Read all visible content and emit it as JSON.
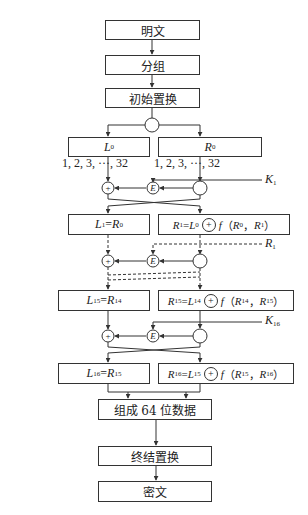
{
  "diagram": {
    "steps": {
      "plaintext": "明文",
      "grouping": "分组",
      "initial_permutation": "初始置换",
      "combine_64": "组成 64 位数据",
      "final_permutation": "终结置换",
      "ciphertext": "密文"
    },
    "round0": {
      "left": {
        "sym": "L",
        "sub": "0"
      },
      "right": {
        "sym": "R",
        "sub": "0"
      },
      "left_indices": "1, 2, 3, ···, 32",
      "right_indices": "1, 2, 3, ···, 32",
      "key": {
        "sym": "K",
        "sub": "1"
      }
    },
    "round1": {
      "left": {
        "lhs": "L",
        "lhs_sub": "1",
        "eq": "=",
        "rhs": "R",
        "rhs_sub": "0"
      },
      "right": {
        "lhs": "R",
        "lhs_sub": "1",
        "eq": "=",
        "a": "L",
        "a_sub": "0",
        "f": "f",
        "open": "（",
        "p1": "R",
        "p1_sub": "0",
        "comma": "，",
        "p2": "R",
        "p2_sub": "1",
        "close": "）"
      },
      "key": {
        "sym": "R",
        "sub": "1"
      }
    },
    "round15": {
      "left": {
        "lhs": "L",
        "lhs_sub": "15",
        "eq": "=",
        "rhs": "R",
        "rhs_sub": "14"
      },
      "right": {
        "lhs": "R",
        "lhs_sub": "15",
        "eq": "=",
        "a": "L",
        "a_sub": "14",
        "f": "f",
        "open": "（",
        "p1": "R",
        "p1_sub": "14",
        "comma": "，",
        "p2": "R",
        "p2_sub": "15",
        "close": "）"
      },
      "key": {
        "sym": "K",
        "sub": "16"
      }
    },
    "round16": {
      "left": {
        "lhs": "L",
        "lhs_sub": "16",
        "eq": "=",
        "rhs": "R",
        "rhs_sub": "15"
      },
      "right": {
        "lhs": "R",
        "lhs_sub": "16",
        "eq": "=",
        "a": "L",
        "a_sub": "15",
        "f": "f",
        "open": "（",
        "p1": "R",
        "p1_sub": "15",
        "comma": "，",
        "p2": "R",
        "p2_sub": "16",
        "close": "）"
      }
    },
    "operators": {
      "xor": "+",
      "expand": "E"
    },
    "colors": {
      "line": "#333333",
      "background": "#ffffff"
    }
  }
}
